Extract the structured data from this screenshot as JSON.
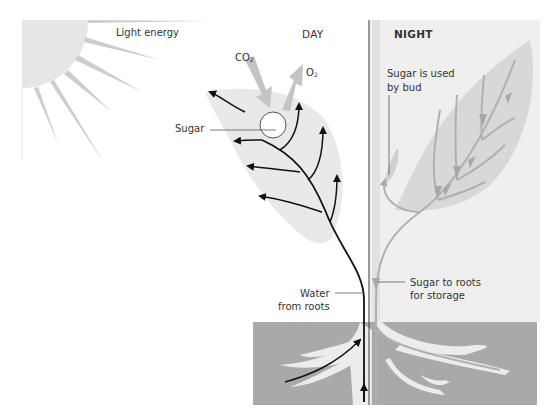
{
  "diagram": {
    "panels": {
      "day": {
        "heading": "DAY"
      },
      "night": {
        "heading": "NIGHT"
      }
    },
    "labels": {
      "light_energy": "Light energy",
      "co2_main": "CO",
      "co2_sub": "2",
      "o2_main": "O",
      "o2_sub": "2",
      "sugar": "Sugar",
      "sugar_used_line1": "Sugar is used",
      "sugar_used_line2": "by bud",
      "water_line1": "Water",
      "water_line2": "from roots",
      "sugar_roots_line1": "Sugar to roots",
      "sugar_roots_line2": "for storage"
    },
    "colors": {
      "background": "#ffffff",
      "sun": "#e6e6e6",
      "rays": "#c8c8c8",
      "leaf_day": "#e9e9e9",
      "night_panel": "#efefef",
      "leaf_night": "#d8d8d8",
      "night_veins": "#b0b0b0",
      "soil": "#a9a9a9",
      "roots": "#e8e8e8",
      "ink": "#111111",
      "gas_arrows": "#c4c4c4"
    }
  }
}
